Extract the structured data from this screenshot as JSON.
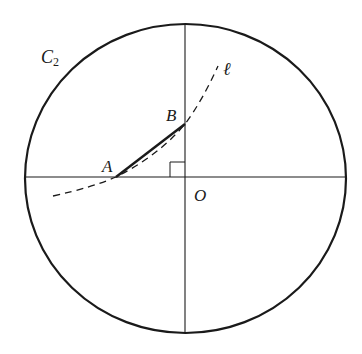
{
  "diagram": {
    "type": "geometry",
    "colors": {
      "stroke": "#1a1a1a",
      "background": "#ffffff"
    },
    "circle": {
      "label": "C",
      "subscript": "2",
      "cx": 185.5,
      "cy": 178.5,
      "rx": 160.5,
      "ry": 154.5
    },
    "axes": {
      "horizontal": {
        "y": 177,
        "x1": 25,
        "x2": 346
      },
      "vertical": {
        "x": 185,
        "y1": 24,
        "y2": 333
      }
    },
    "points": [
      {
        "name": "A",
        "x": 116,
        "y": 177
      },
      {
        "name": "B",
        "x": 185,
        "y": 124
      },
      {
        "name": "O",
        "x": 185,
        "y": 177
      }
    ],
    "segment": {
      "from": "A",
      "to": "B",
      "style": "solid-bold"
    },
    "curve": {
      "label": "ℓ",
      "style": "dashed",
      "from": [
        53,
        196
      ],
      "to": [
        218,
        66
      ]
    },
    "right_angle_marker": {
      "at": "O",
      "size": 15
    },
    "labels": {
      "c2": "C",
      "c2_sub": "2",
      "a": "A",
      "b": "B",
      "o": "O",
      "ell": "ℓ"
    }
  }
}
